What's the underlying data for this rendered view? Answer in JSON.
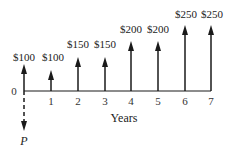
{
  "diagram": {
    "type": "cash-flow-diagram",
    "axis": {
      "origin_label": "0",
      "title": "Years"
    },
    "present_value": {
      "label": "P",
      "direction": "down",
      "style": "dashed"
    },
    "cash_flows": [
      {
        "year": "0",
        "amount": "$100"
      },
      {
        "year": "1",
        "amount": "$100"
      },
      {
        "year": "2",
        "amount": "$150"
      },
      {
        "year": "3",
        "amount": "$150"
      },
      {
        "year": "4",
        "amount": "$200"
      },
      {
        "year": "5",
        "amount": "$200"
      },
      {
        "year": "6",
        "amount": "$250"
      },
      {
        "year": "7",
        "amount": "$250"
      }
    ],
    "tick_labels": [
      "1",
      "2",
      "3",
      "4",
      "5",
      "6",
      "7"
    ]
  },
  "colors": {
    "ink": "#1a1a1a",
    "background": "#ffffff"
  }
}
